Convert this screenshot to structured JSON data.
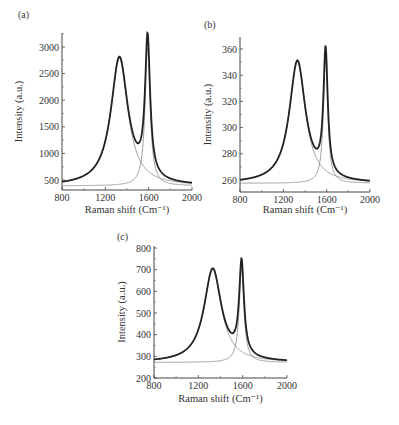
{
  "chart_data": [
    {
      "panel": "(a)",
      "type": "line",
      "xlabel": "Raman shift (Cm⁻¹)",
      "ylabel": "Intensity (a.u.)",
      "xlim": [
        800,
        2000
      ],
      "ylim": [
        300,
        3250
      ],
      "xticks": [
        800,
        1200,
        1600,
        2000
      ],
      "yticks": [
        500,
        1000,
        1500,
        2000,
        2500,
        3000
      ],
      "baseline": 390,
      "peaks": [
        {
          "name": "D band",
          "center": 1330,
          "height": 2400,
          "hwhm": 95
        },
        {
          "name": "G band",
          "center": 1590,
          "height": 2600,
          "hwhm": 28
        }
      ],
      "series": [
        {
          "name": "measured",
          "x": [
            800,
            1000,
            1200,
            1300,
            1330,
            1400,
            1500,
            1560,
            1590,
            1620,
            1700,
            1800,
            2000
          ],
          "values": [
            460,
            580,
            1400,
            2700,
            2820,
            2050,
            1130,
            2100,
            3050,
            1900,
            820,
            560,
            450
          ]
        },
        {
          "name": "D fit",
          "x": [
            800,
            1200,
            1330,
            1500,
            2000
          ],
          "values": [
            400,
            1210,
            2790,
            850,
            440
          ]
        },
        {
          "name": "G fit",
          "x": [
            800,
            1400,
            1590,
            1700,
            2000
          ],
          "values": [
            400,
            470,
            2990,
            640,
            430
          ]
        }
      ]
    },
    {
      "panel": "(b)",
      "type": "line",
      "xlabel": "Raman shift (Cm⁻¹)",
      "ylabel": "Intensity (a.u.)",
      "xlim": [
        800,
        2000
      ],
      "ylim": [
        251,
        369
      ],
      "xticks": [
        800,
        1200,
        1600,
        2000
      ],
      "yticks": [
        260,
        280,
        300,
        320,
        340,
        360
      ],
      "baseline": 257.5,
      "peaks": [
        {
          "name": "D band",
          "center": 1330,
          "height": 93,
          "hwhm": 90
        },
        {
          "name": "G band",
          "center": 1590,
          "height": 95,
          "hwhm": 24
        }
      ],
      "series": [
        {
          "name": "measured",
          "x": [
            800,
            1000,
            1200,
            1300,
            1330,
            1400,
            1500,
            1560,
            1590,
            1620,
            1700,
            1800,
            2000
          ],
          "values": [
            260,
            264,
            290,
            345,
            352,
            322,
            284,
            320,
            360,
            310,
            274,
            264,
            259
          ]
        },
        {
          "name": "D fit",
          "x": [
            800,
            1200,
            1330,
            1500,
            2000
          ],
          "values": [
            258,
            283,
            350,
            276,
            260
          ]
        },
        {
          "name": "G fit",
          "x": [
            800,
            1400,
            1590,
            1700,
            2000
          ],
          "values": [
            258,
            260,
            352,
            263,
            258
          ]
        }
      ]
    },
    {
      "panel": "(c)",
      "type": "line",
      "xlabel": "Raman shift (Cm⁻¹)",
      "ylabel": "Intensity (a.u.)",
      "xlim": [
        800,
        2000
      ],
      "ylim": [
        200,
        800
      ],
      "xticks": [
        800,
        1200,
        1600,
        2000
      ],
      "yticks": [
        200,
        300,
        400,
        500,
        600,
        700,
        800
      ],
      "baseline": 272,
      "peaks": [
        {
          "name": "D band",
          "center": 1330,
          "height": 430,
          "hwhm": 95
        },
        {
          "name": "G band",
          "center": 1590,
          "height": 430,
          "hwhm": 26
        }
      ],
      "series": [
        {
          "name": "measured",
          "x": [
            800,
            1000,
            1200,
            1300,
            1330,
            1400,
            1500,
            1560,
            1590,
            1620,
            1700,
            1800,
            2000
          ],
          "values": [
            285,
            305,
            450,
            690,
            712,
            560,
            400,
            560,
            740,
            520,
            330,
            295,
            280
          ]
        },
        {
          "name": "D fit",
          "x": [
            800,
            1200,
            1330,
            1500,
            2000
          ],
          "values": [
            280,
            400,
            700,
            360,
            285
          ]
        },
        {
          "name": "G fit",
          "x": [
            800,
            1400,
            1590,
            1700,
            2000
          ],
          "values": [
            272,
            280,
            700,
            300,
            275
          ]
        }
      ]
    }
  ]
}
